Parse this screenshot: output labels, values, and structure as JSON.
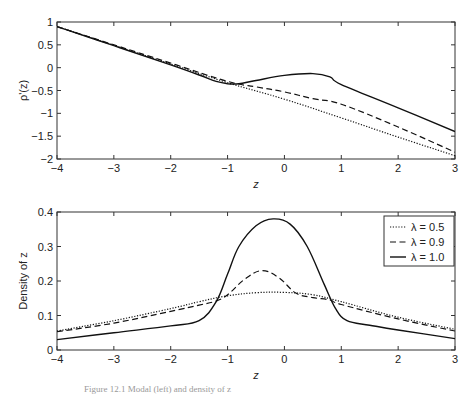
{
  "caption": "Figure 12.1  Modal (left) and density of z",
  "chart_data": [
    {
      "type": "line",
      "title": "",
      "xlabel": "z",
      "ylabel": "ρ'(z)",
      "xlim": [
        -4,
        3
      ],
      "ylim": [
        -2,
        1
      ],
      "xticks": [
        "-4",
        "-3",
        "-2",
        "-1",
        "0",
        "1",
        "2",
        "3"
      ],
      "yticks": [
        "1",
        "0.5",
        "0",
        "-0.5",
        "-1",
        "-1.5",
        "-2"
      ],
      "grid": false,
      "series": [
        {
          "name": "λ = 0.5",
          "style": "dotted",
          "x": [
            -4,
            -3,
            -2,
            -1,
            0,
            1,
            2,
            3
          ],
          "y": [
            0.9,
            0.49,
            0.08,
            -0.33,
            -0.69,
            -1.1,
            -1.52,
            -1.93
          ]
        },
        {
          "name": "λ = 0.9",
          "style": "dashed",
          "x": [
            -4,
            -3,
            -2,
            -1,
            -0.5,
            0,
            0.5,
            1,
            2,
            3
          ],
          "y": [
            0.9,
            0.5,
            0.1,
            -0.3,
            -0.42,
            -0.53,
            -0.68,
            -0.8,
            -1.3,
            -1.85
          ]
        },
        {
          "name": "λ = 1.0",
          "style": "solid",
          "x": [
            -4,
            -3,
            -2,
            -1.5,
            -1.2,
            -1,
            -0.8,
            -0.5,
            0,
            0.5,
            0.8,
            1,
            2,
            3
          ],
          "y": [
            0.9,
            0.48,
            0.06,
            -0.16,
            -0.3,
            -0.35,
            -0.35,
            -0.28,
            -0.17,
            -0.13,
            -0.2,
            -0.37,
            -0.88,
            -1.4
          ]
        }
      ]
    },
    {
      "type": "line",
      "title": "",
      "xlabel": "z",
      "ylabel": "Density of z",
      "xlim": [
        -4,
        3
      ],
      "ylim": [
        0,
        0.4
      ],
      "xticks": [
        "-4",
        "-3",
        "-2",
        "-1",
        "0",
        "1",
        "2",
        "3"
      ],
      "yticks": [
        "0.4",
        "0.3",
        "0.2",
        "0.1",
        "0"
      ],
      "grid": false,
      "legend_position": "upper right",
      "legend": [
        "λ = 0.5",
        "λ = 0.9",
        "λ = 1.0"
      ],
      "series": [
        {
          "name": "λ = 0.5",
          "style": "dotted",
          "x": [
            -4,
            -3,
            -2,
            -1.5,
            -1,
            -0.5,
            0,
            0.5,
            1,
            2,
            3
          ],
          "y": [
            0.055,
            0.085,
            0.12,
            0.14,
            0.157,
            0.166,
            0.167,
            0.16,
            0.14,
            0.095,
            0.06
          ]
        },
        {
          "name": "λ = 0.9",
          "style": "dashed",
          "x": [
            -4,
            -3,
            -2,
            -1.5,
            -1.2,
            -1,
            -0.7,
            -0.4,
            -0.1,
            0.2,
            0.5,
            0.8,
            1,
            2,
            3
          ],
          "y": [
            0.053,
            0.078,
            0.112,
            0.13,
            0.142,
            0.16,
            0.205,
            0.23,
            0.21,
            0.165,
            0.152,
            0.145,
            0.132,
            0.09,
            0.055
          ]
        },
        {
          "name": "λ = 1.0",
          "style": "solid",
          "x": [
            -4,
            -3,
            -2,
            -1.5,
            -1.2,
            -1,
            -0.8,
            -0.5,
            -0.2,
            0.1,
            0.4,
            0.7,
            0.9,
            1.1,
            1.5,
            2,
            3
          ],
          "y": [
            0.03,
            0.05,
            0.07,
            0.085,
            0.14,
            0.22,
            0.3,
            0.36,
            0.38,
            0.365,
            0.3,
            0.19,
            0.12,
            0.085,
            0.072,
            0.058,
            0.033
          ]
        }
      ]
    }
  ]
}
